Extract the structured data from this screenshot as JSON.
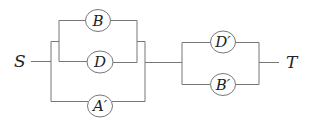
{
  "diagram": {
    "type": "series-parallel network",
    "terminals": {
      "source": "S",
      "target": "T"
    },
    "left_block": {
      "inner_parallel": [
        "B",
        "D"
      ],
      "bypass": "A′"
    },
    "right_block": {
      "parallel": [
        "D′",
        "B′"
      ]
    },
    "colors": {
      "wire": "#777777",
      "text": "#222222",
      "background": "#ffffff"
    }
  }
}
